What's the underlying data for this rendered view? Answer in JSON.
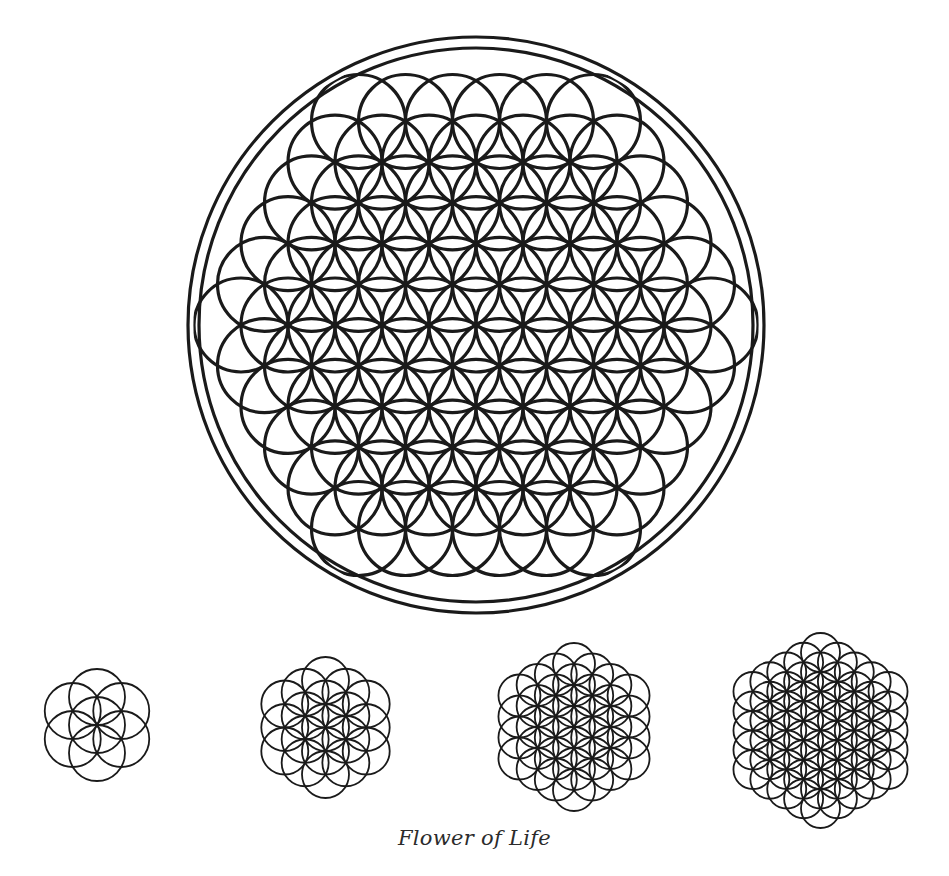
{
  "caption": "Flower of Life",
  "colors": {
    "stroke": "#1a1a1a",
    "background": "#ffffff"
  },
  "main_figure": {
    "name": "flower-of-life-main",
    "center": [
      476,
      325
    ],
    "spacing": 47,
    "vertical_scale": 1.0,
    "circle_center_radius_steps": 5,
    "clip_radius": 281,
    "frame_radii": [
      288,
      277
    ],
    "stroke_width": 3.2,
    "frame_stroke_width": 3.2
  },
  "stages": [
    {
      "name": "seed-of-life",
      "label": "7 circles",
      "center": [
        97,
        725
      ],
      "spacing": 28,
      "rings": 1,
      "stroke_width": 1.8
    },
    {
      "name": "egg-of-life-19",
      "label": "19 circles",
      "center": [
        325,
        727
      ],
      "spacing": 23.5,
      "rings": 2,
      "stroke_width": 1.8
    },
    {
      "name": "fruit-37",
      "label": "37 circles",
      "center": [
        574,
        727
      ],
      "spacing": 21,
      "rings": 3,
      "stroke_width": 1.8
    },
    {
      "name": "flower-61",
      "label": "61 circles",
      "center": [
        820,
        730
      ],
      "spacing": 19.5,
      "rings": 4,
      "stroke_width": 1.8
    }
  ]
}
